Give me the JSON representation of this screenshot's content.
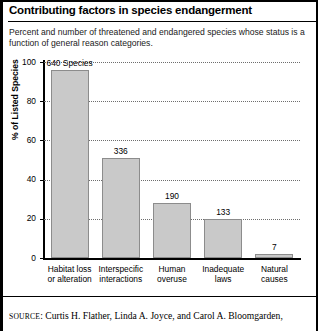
{
  "figure": {
    "title": "Contributing factors in species endangerment",
    "subtitle": "Percent and number of threatened and endangered species whose status is a function of general reason categories.",
    "source_prefix": "SOURCE",
    "source_text": "Curtis H. Flather, Linda A. Joyce, and Carol A. Bloomgarden,",
    "frame_color": "#000000"
  },
  "chart_data": {
    "type": "bar",
    "title": "Contributing factors in species endangerment",
    "xlabel": "",
    "ylabel": "% of Listed Species",
    "ylim": [
      0,
      100
    ],
    "yticks": [
      0,
      20,
      40,
      60,
      80,
      100
    ],
    "ytick_labels": [
      "0",
      "20",
      "40",
      "60",
      "80",
      "100"
    ],
    "grid": true,
    "legend": "none",
    "bar_color": "#c9c9c9",
    "bar_edge_color": "#8c8c8c",
    "categories": [
      "Habitat loss or alteration",
      "Interspecific interactions",
      "Human overuse",
      "Inadequate laws",
      "Natural causes"
    ],
    "category_lines": [
      [
        "Habitat loss",
        "or alteration"
      ],
      [
        "Interspecific",
        "interactions"
      ],
      [
        "Human",
        "overuse"
      ],
      [
        "Inadequate",
        "laws"
      ],
      [
        "Natural",
        "causes"
      ]
    ],
    "values": [
      96,
      51,
      28,
      20,
      2
    ],
    "data_labels": [
      "640 Species",
      "336",
      "190",
      "133",
      "7"
    ],
    "counts": [
      640,
      336,
      190,
      133,
      7
    ]
  }
}
